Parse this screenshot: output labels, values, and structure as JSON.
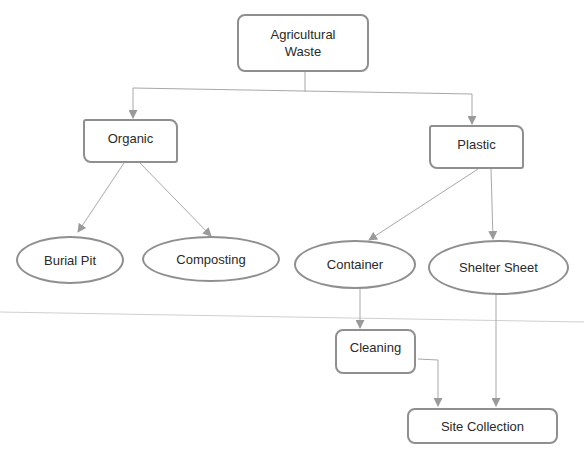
{
  "diagram": {
    "nodes": {
      "agricultural_waste": {
        "label_line1": "Agricultural",
        "label_line2": "Waste"
      },
      "organic": {
        "label": "Organic"
      },
      "plastic": {
        "label": "Plastic"
      },
      "burial_pit": {
        "label": "Burial Pit"
      },
      "composting": {
        "label": "Composting"
      },
      "container": {
        "label": "Container"
      },
      "shelter_sheet": {
        "label": "Shelter Sheet"
      },
      "cleaning": {
        "label": "Cleaning"
      },
      "site_collection": {
        "label": "Site Collection"
      }
    },
    "edges": [
      [
        "Agricultural Waste",
        "Organic"
      ],
      [
        "Agricultural Waste",
        "Plastic"
      ],
      [
        "Organic",
        "Burial Pit"
      ],
      [
        "Organic",
        "Composting"
      ],
      [
        "Plastic",
        "Container"
      ],
      [
        "Plastic",
        "Shelter Sheet"
      ],
      [
        "Container",
        "Cleaning"
      ],
      [
        "Cleaning",
        "Site Collection"
      ],
      [
        "Shelter Sheet",
        "Site Collection"
      ]
    ],
    "colors": {
      "stroke": "#8f8f8f",
      "text": "#2a2a2a"
    }
  }
}
